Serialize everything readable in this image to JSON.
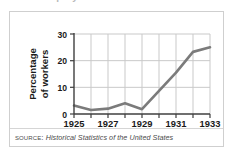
{
  "figure": {
    "title_remnant": "Unemployment in the United States",
    "source": {
      "label": "Source:",
      "title": "Historical Statistics of the United States"
    }
  },
  "chart_data": {
    "type": "line",
    "title": "",
    "xlabel": "",
    "ylabel": "Percentage of workers",
    "ylabel_line1": "Percentage",
    "ylabel_line2": "of workers",
    "x": [
      1925,
      1926,
      1927,
      1928,
      1929,
      1930,
      1931,
      1932,
      1933
    ],
    "values": [
      3.2,
      1.5,
      2.0,
      4.0,
      1.8,
      8.7,
      15.5,
      23.3,
      25.0
    ],
    "series": [
      {
        "name": "Percentage of workers unemployed",
        "values": [
          3.2,
          1.5,
          2.0,
          4.0,
          1.8,
          8.7,
          15.5,
          23.3,
          25.0
        ]
      }
    ],
    "xlim": [
      1925,
      1933
    ],
    "ylim": [
      0,
      30
    ],
    "yticks": [
      0,
      10,
      20,
      30
    ],
    "ytick_labels": [
      "0",
      "10",
      "20",
      "30"
    ],
    "xticks": [
      1925,
      1927,
      1929,
      1931,
      1933
    ],
    "xtick_labels": [
      "1925",
      "1927",
      "1929",
      "1931",
      "1933"
    ],
    "xticks_minor": [
      1926,
      1928,
      1930,
      1932
    ],
    "grid": true,
    "grid_x": true,
    "grid_y": true,
    "legend": false,
    "legend_position": "none",
    "line_color": "#7b7b7b",
    "grid_color": "#c9c9c9",
    "axis_color": "#3f3f3f"
  }
}
